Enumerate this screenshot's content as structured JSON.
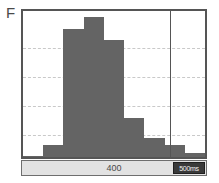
{
  "panel": {
    "letter": "F"
  },
  "axis_strip": {
    "center_label": "400",
    "scale_badge_label": "500ms"
  },
  "colors": {
    "bar_fill": "#646464",
    "frame": "#555555",
    "gridline": "#c9c9c9",
    "axis_strip_background": "#e2e2e2",
    "badge_background": "#3a3a3a",
    "badge_text": "#f2f2f2",
    "panel_letter": "#4a4a4a"
  },
  "chart_data": {
    "type": "bar",
    "title": "",
    "subtitle": "",
    "xlabel": "400",
    "ylabel": "",
    "grid": true,
    "legend": null,
    "xlim": [
      0,
      9
    ],
    "ylim": [
      0,
      100
    ],
    "categories": [
      "1",
      "2",
      "3",
      "4",
      "5",
      "6",
      "7",
      "8",
      "9"
    ],
    "values": [
      1,
      8,
      88,
      96,
      80,
      27,
      13,
      8,
      3
    ],
    "bar_left_percent": [
      0.0,
      11.1,
      22.2,
      33.3,
      44.4,
      55.6,
      66.7,
      77.8,
      88.9
    ],
    "bar_width_percent": 11.1,
    "gridlines_y_percent": [
      25,
      45,
      65,
      85
    ],
    "cursor_line_x_percent": 81,
    "annotations": [
      {
        "name": "panel-letter",
        "text": "F"
      },
      {
        "name": "axis-scale",
        "text": "400"
      },
      {
        "name": "time-scale-badge",
        "text": "500ms"
      }
    ]
  }
}
